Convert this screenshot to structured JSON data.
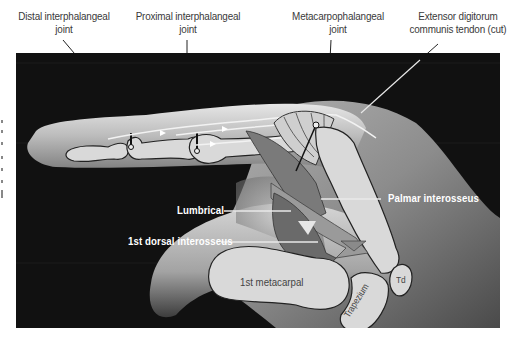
{
  "figure": {
    "type": "anatomical-diagram",
    "top_labels": [
      {
        "id": "dip",
        "line1": "Distal interphalangeal",
        "line2": "joint"
      },
      {
        "id": "pip",
        "line1": "Proximal interphalangeal",
        "line2": "joint"
      },
      {
        "id": "mcp",
        "line1": "Metacarpophalangeal",
        "line2": "joint"
      },
      {
        "id": "edc",
        "line1": "Extensor digitorum",
        "line2": "communis tendon (cut)"
      }
    ],
    "callouts": {
      "lumbrical": "Lumbrical",
      "palmar_interosseus": "Palmar interosseus",
      "dorsal_interosseus": "1st dorsal interosseus"
    },
    "bone_labels": {
      "first_metacarpal": "1st metacarpal",
      "trapezium": "Trapezium",
      "trapezoid": "Td"
    },
    "colors": {
      "background": "#111111",
      "skin_light": "#c9c9c9",
      "skin_mid": "#8f8f8f",
      "bone_fill": "#d9d9d9",
      "muscle_dark": "#6e6e6e",
      "muscle_mid": "#8a8a8a",
      "label_white": "#ffffff",
      "label_dark": "#3a3a3a"
    }
  }
}
